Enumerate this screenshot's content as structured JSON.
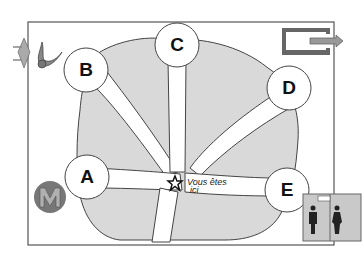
{
  "map": {
    "type": "floor-plan",
    "colors": {
      "frame": "#555555",
      "area_fill": "#d8d8d8",
      "path_fill": "#ffffff",
      "outline": "#444444",
      "metro_badge": "#777777",
      "exit_sign": "#6d6d6d",
      "toilet_sign_bg": "#c9c9c9"
    },
    "exits": [
      {
        "id": "A",
        "label": "A"
      },
      {
        "id": "B",
        "label": "B"
      },
      {
        "id": "C",
        "label": "C"
      },
      {
        "id": "D",
        "label": "D"
      },
      {
        "id": "E",
        "label": "E"
      }
    ],
    "you_are_here": {
      "icon": "star-icon",
      "line1": "Vous êtes",
      "line2": "ici"
    },
    "icons": {
      "metro": {
        "icon": "metro-icon",
        "letter": "M"
      },
      "exit": {
        "icon": "exit-arrow-icon"
      },
      "toilets": {
        "icon": "toilets-icon",
        "sign": "WC"
      },
      "taxi_horn": {
        "icon": "horn-icon",
        "text": "TAXI"
      }
    }
  }
}
